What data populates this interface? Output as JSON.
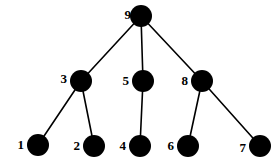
{
  "figure": {
    "title": "",
    "background_color": "#ffffff",
    "node_color": "#000000",
    "edge_color": "#000000",
    "label_color": "#000000",
    "width": 278,
    "height": 162
  },
  "chart_data": {
    "type": "diagram",
    "diagram_type": "tree",
    "title": "",
    "node_count": 9,
    "edge_count": 8,
    "nodes": [
      {
        "id": "9",
        "label": "9",
        "x": 141,
        "y": 16,
        "r": 11,
        "level": 0,
        "label_x": 131,
        "label_y": 14
      },
      {
        "id": "3",
        "label": "3",
        "x": 81,
        "y": 81,
        "r": 11,
        "level": 1,
        "label_x": 67,
        "label_y": 78
      },
      {
        "id": "5",
        "label": "5",
        "x": 143,
        "y": 81,
        "r": 11,
        "level": 1,
        "label_x": 129,
        "label_y": 80
      },
      {
        "id": "8",
        "label": "8",
        "x": 202,
        "y": 81,
        "r": 11,
        "level": 1,
        "label_x": 188,
        "label_y": 80
      },
      {
        "id": "1",
        "label": "1",
        "x": 38,
        "y": 145,
        "r": 11,
        "level": 2,
        "label_x": 24,
        "label_y": 144
      },
      {
        "id": "2",
        "label": "2",
        "x": 94,
        "y": 146,
        "r": 11,
        "level": 2,
        "label_x": 80,
        "label_y": 145
      },
      {
        "id": "4",
        "label": "4",
        "x": 140,
        "y": 146,
        "r": 11,
        "level": 2,
        "label_x": 126,
        "label_y": 145
      },
      {
        "id": "6",
        "label": "6",
        "x": 188,
        "y": 146,
        "r": 11,
        "level": 2,
        "label_x": 174,
        "label_y": 145
      },
      {
        "id": "7",
        "label": "7",
        "x": 260,
        "y": 146,
        "r": 11,
        "level": 2,
        "label_x": 246,
        "label_y": 147
      }
    ],
    "edges": [
      {
        "source": "9",
        "target": "3",
        "x1": 141,
        "y1": 16,
        "x2": 81,
        "y2": 81
      },
      {
        "source": "9",
        "target": "5",
        "x1": 141,
        "y1": 16,
        "x2": 143,
        "y2": 81
      },
      {
        "source": "9",
        "target": "8",
        "x1": 141,
        "y1": 16,
        "x2": 202,
        "y2": 81
      },
      {
        "source": "3",
        "target": "1",
        "x1": 81,
        "y1": 81,
        "x2": 38,
        "y2": 145
      },
      {
        "source": "3",
        "target": "2",
        "x1": 81,
        "y1": 81,
        "x2": 94,
        "y2": 146
      },
      {
        "source": "5",
        "target": "4",
        "x1": 143,
        "y1": 81,
        "x2": 140,
        "y2": 146
      },
      {
        "source": "8",
        "target": "6",
        "x1": 202,
        "y1": 81,
        "x2": 188,
        "y2": 146
      },
      {
        "source": "8",
        "target": "7",
        "x1": 202,
        "y1": 81,
        "x2": 260,
        "y2": 146
      }
    ],
    "edge_width": 1.6,
    "legend": [],
    "annotations": []
  }
}
